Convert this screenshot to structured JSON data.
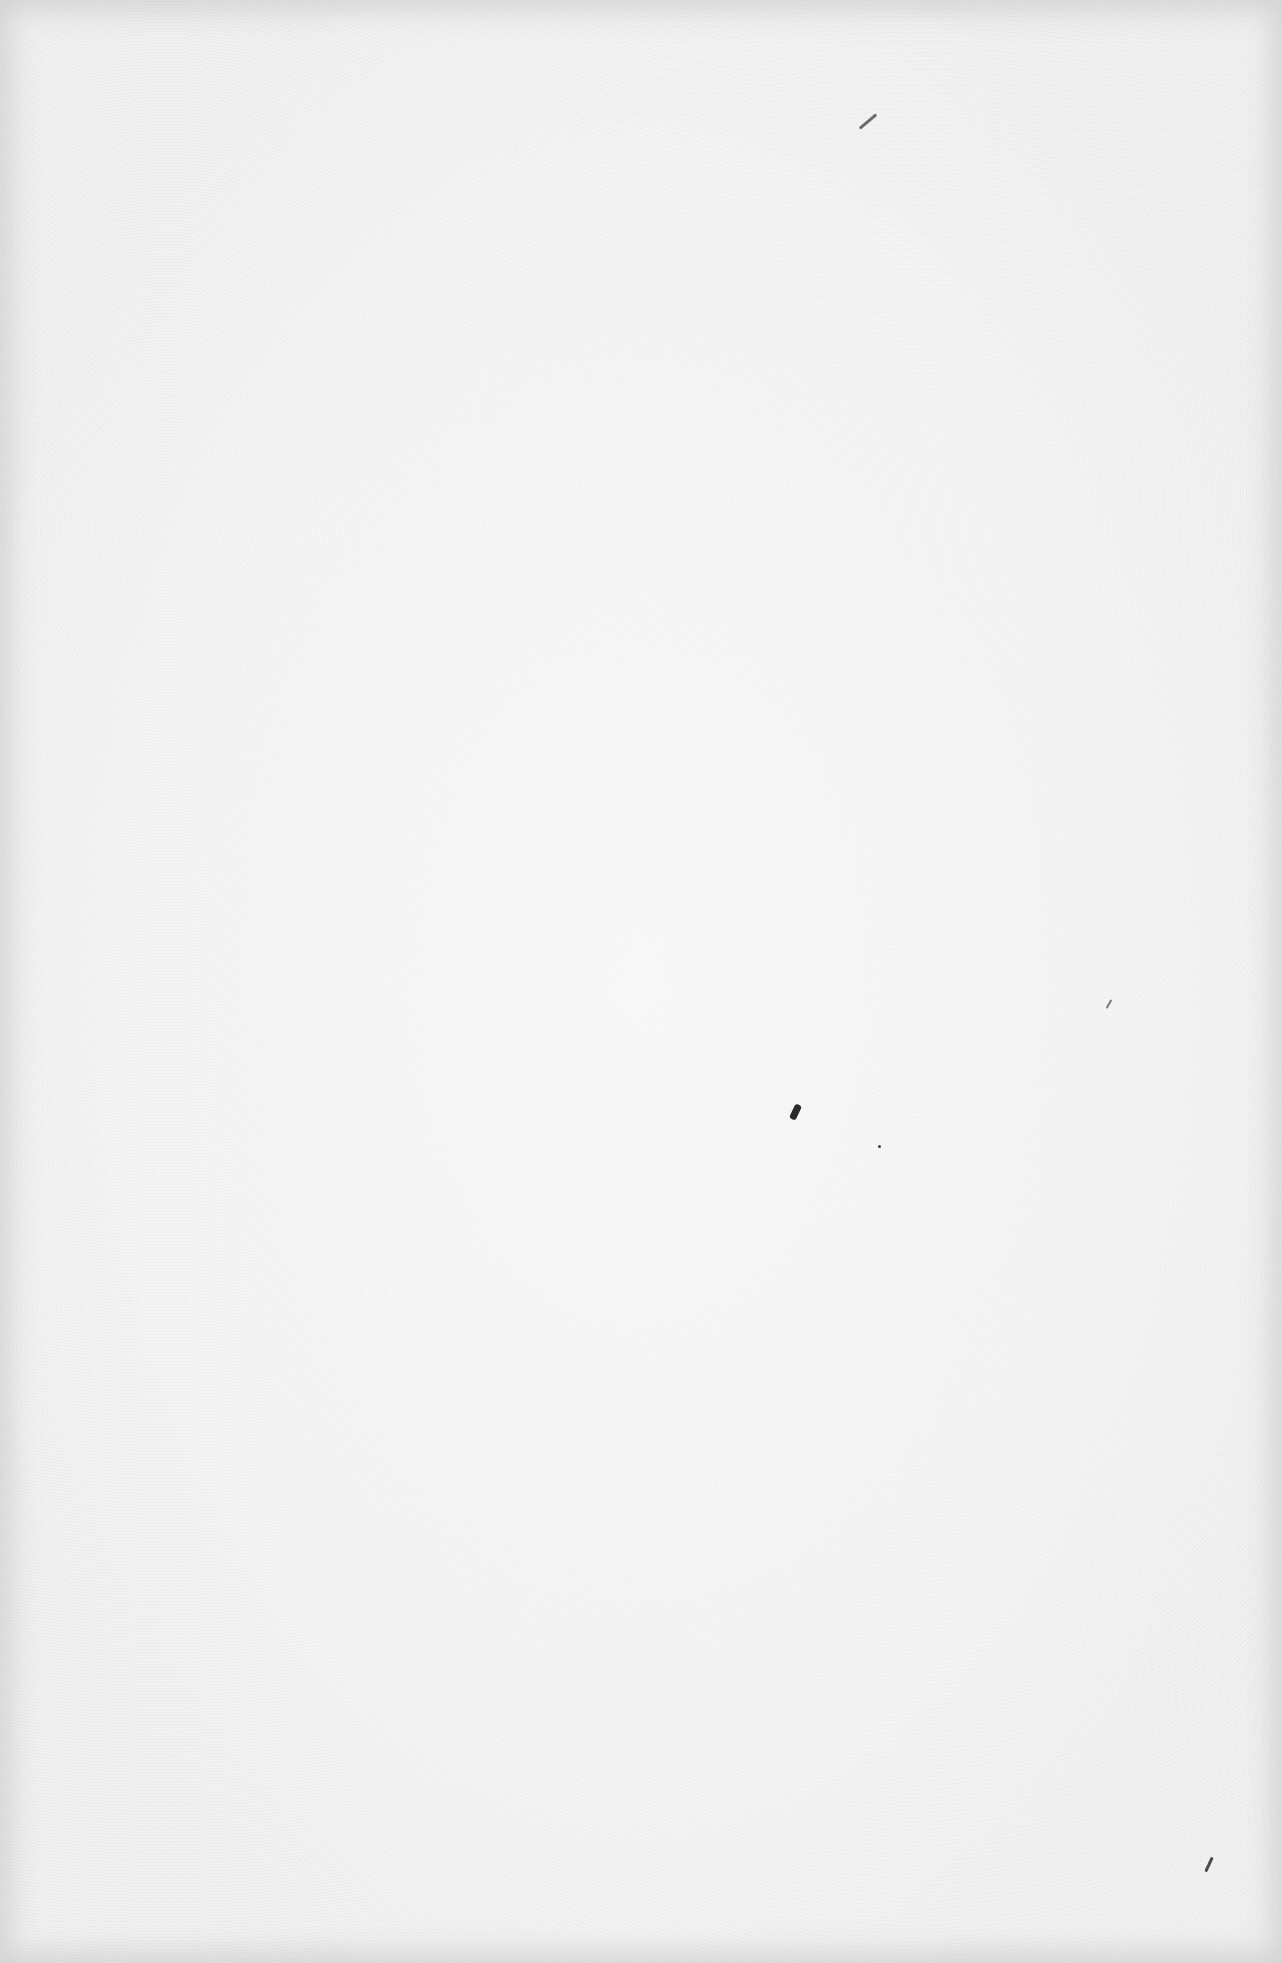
{
  "page": {
    "kind": "blank scanned page",
    "background_color": "#f1f1f1",
    "vignette_color": "#bebebe",
    "content_text": ""
  },
  "marks": [
    {
      "name": "speck-top-right-stroke",
      "x": 857,
      "y": 120,
      "w": 22,
      "h": 3,
      "rotate": -40,
      "color": "#6a6a6a"
    },
    {
      "name": "speck-right-mid-stroke",
      "x": 1104,
      "y": 1003,
      "w": 10,
      "h": 2,
      "rotate": -60,
      "color": "#7a7a7a"
    },
    {
      "name": "speck-center-comma",
      "x": 792,
      "y": 1104,
      "w": 7,
      "h": 16,
      "rotate": 25,
      "color": "#2a2a2a"
    },
    {
      "name": "speck-center-dot",
      "x": 878,
      "y": 1145,
      "w": 3,
      "h": 3,
      "rotate": 0,
      "color": "#3a3a3a"
    },
    {
      "name": "speck-bottom-right-stroke",
      "x": 1201,
      "y": 1863,
      "w": 16,
      "h": 3,
      "rotate": -65,
      "color": "#4a4a4a"
    }
  ]
}
